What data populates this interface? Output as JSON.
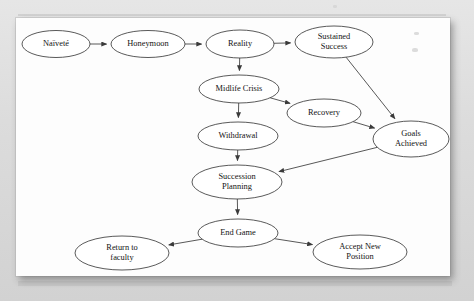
{
  "document": {
    "kind": "scanned-page",
    "page_background": "#fdfdfd",
    "canvas_background": "#d9d9d9",
    "ink_color": "#3c3c3c",
    "text_color": "#131313"
  },
  "chart_data": {
    "type": "diagram",
    "diagram_kind": "flowchart",
    "title": "",
    "node_shape": "ellipse",
    "edge_style": "straight-arrow",
    "nodes": [
      {
        "id": "naivete",
        "label": "Naïveté",
        "lines": [
          "Naïveté"
        ],
        "cx": 56,
        "cy": 44,
        "rx": 34,
        "ry": 13.5
      },
      {
        "id": "honeymoon",
        "label": "Honeymoon",
        "lines": [
          "Honeymoon"
        ],
        "cx": 148,
        "cy": 44,
        "rx": 37,
        "ry": 13.5
      },
      {
        "id": "reality",
        "label": "Reality",
        "lines": [
          "Reality"
        ],
        "cx": 240,
        "cy": 44,
        "rx": 34,
        "ry": 14
      },
      {
        "id": "sustained-success",
        "label": "Sustained Success",
        "lines": [
          "Sustained",
          "Success"
        ],
        "cx": 334,
        "cy": 42,
        "rx": 39,
        "ry": 16
      },
      {
        "id": "midlife-crisis",
        "label": "Midlife Crisis",
        "lines": [
          "Midlife Crisis"
        ],
        "cx": 239,
        "cy": 89,
        "rx": 40,
        "ry": 14
      },
      {
        "id": "recovery",
        "label": "Recovery",
        "lines": [
          "Recovery"
        ],
        "cx": 324,
        "cy": 113,
        "rx": 37,
        "ry": 14
      },
      {
        "id": "withdrawal",
        "label": "Withdrawal",
        "lines": [
          "Withdrawal"
        ],
        "cx": 238,
        "cy": 136,
        "rx": 40,
        "ry": 14
      },
      {
        "id": "goals-achieved",
        "label": "Goals Achieved",
        "lines": [
          "Goals",
          "Achieved"
        ],
        "cx": 411,
        "cy": 139,
        "rx": 38,
        "ry": 18
      },
      {
        "id": "succession-planning",
        "label": "Succession Planning",
        "lines": [
          "Succession",
          "Planning"
        ],
        "cx": 237,
        "cy": 182,
        "rx": 45,
        "ry": 17
      },
      {
        "id": "end-game",
        "label": "End Game",
        "lines": [
          "End Game"
        ],
        "cx": 238,
        "cy": 233,
        "rx": 40,
        "ry": 14
      },
      {
        "id": "return-to-faculty",
        "label": "Return to faculty",
        "lines": [
          "Return to",
          "faculty"
        ],
        "cx": 122,
        "cy": 253,
        "rx": 47,
        "ry": 17
      },
      {
        "id": "accept-new-position",
        "label": "Accept New Position",
        "lines": [
          "Accept New",
          "Position"
        ],
        "cx": 360,
        "cy": 252,
        "rx": 47,
        "ry": 17
      }
    ],
    "edges": [
      {
        "from": "naivete",
        "to": "honeymoon"
      },
      {
        "from": "honeymoon",
        "to": "reality"
      },
      {
        "from": "reality",
        "to": "sustained-success"
      },
      {
        "from": "reality",
        "to": "midlife-crisis"
      },
      {
        "from": "midlife-crisis",
        "to": "recovery"
      },
      {
        "from": "midlife-crisis",
        "to": "withdrawal"
      },
      {
        "from": "sustained-success",
        "to": "goals-achieved"
      },
      {
        "from": "recovery",
        "to": "goals-achieved"
      },
      {
        "from": "withdrawal",
        "to": "succession-planning"
      },
      {
        "from": "goals-achieved",
        "to": "succession-planning"
      },
      {
        "from": "succession-planning",
        "to": "end-game"
      },
      {
        "from": "end-game",
        "to": "return-to-faculty"
      },
      {
        "from": "end-game",
        "to": "accept-new-position"
      }
    ]
  }
}
